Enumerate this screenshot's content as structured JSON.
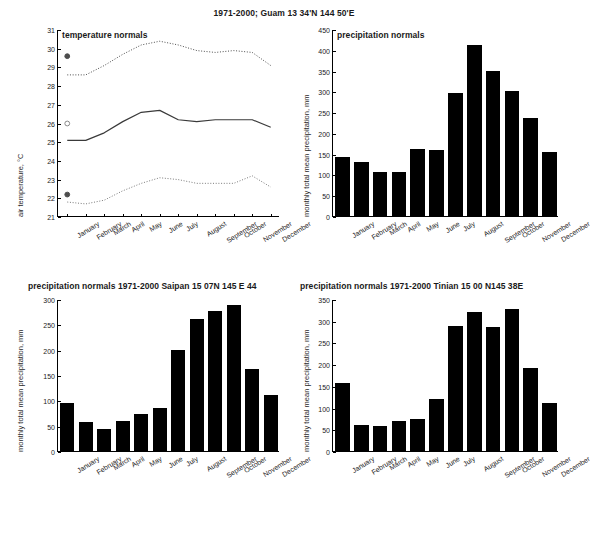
{
  "figure": {
    "title": "1971-2000; Guam 13 34'N 144 50'E",
    "caption": ""
  },
  "chart_data": [
    {
      "id": "temperature-normals",
      "type": "line",
      "title": "temperature normals",
      "xlabel": "",
      "ylabel": "air temperature, °C",
      "ylim": [
        21,
        31
      ],
      "yticks": [
        21,
        22,
        23,
        24,
        25,
        26,
        27,
        28,
        29,
        30,
        31
      ],
      "grid": false,
      "legend": "none",
      "categories": [
        "January",
        "February",
        "March",
        "April",
        "May",
        "June",
        "July",
        "August",
        "September",
        "October",
        "November",
        "December"
      ],
      "series": [
        {
          "name": "mean daily maximum",
          "style": "dotted",
          "color": "#4d4d4d",
          "values": [
            28.6,
            28.6,
            29.1,
            29.7,
            30.2,
            30.4,
            30.2,
            29.9,
            29.8,
            29.9,
            29.8,
            29.1
          ]
        },
        {
          "name": "mean daily temperature",
          "style": "solid",
          "color": "#3a3a3a",
          "values": [
            25.1,
            25.1,
            25.5,
            26.1,
            26.6,
            26.7,
            26.2,
            26.1,
            26.2,
            26.2,
            26.2,
            25.8
          ]
        },
        {
          "name": "mean daily minimum",
          "style": "dotted",
          "color": "#7a7a7a",
          "values": [
            21.8,
            21.7,
            21.9,
            22.4,
            22.8,
            23.1,
            23.0,
            22.8,
            22.8,
            22.8,
            23.2,
            22.6
          ]
        }
      ],
      "markers": [
        {
          "name": "annual-mean-maximum-marker",
          "symbol": "filled-circle",
          "color": "#4d4d4d",
          "x_category": "January",
          "y": 29.6
        },
        {
          "name": "annual-mean-marker",
          "symbol": "open-circle",
          "color": "#8a8a8a",
          "x_category": "January",
          "y": 26.0
        },
        {
          "name": "annual-mean-minimum-marker",
          "symbol": "filled-circle",
          "color": "#4d4d4d",
          "x_category": "January",
          "y": 22.2
        }
      ]
    },
    {
      "id": "precipitation-normals-guam",
      "type": "bar",
      "title": "precipitation normals",
      "xlabel": "",
      "ylabel": "monthly total mean precipitation, mm",
      "ylim": [
        0,
        450
      ],
      "yticks": [
        0,
        50,
        100,
        150,
        200,
        250,
        300,
        350,
        400,
        450
      ],
      "grid": false,
      "bar_color": "#000000",
      "categories": [
        "January",
        "February",
        "March",
        "April",
        "May",
        "June",
        "July",
        "August",
        "September",
        "October",
        "November",
        "December"
      ],
      "values": [
        141,
        129,
        107,
        105,
        162,
        159,
        296,
        411,
        348,
        301,
        237,
        154
      ]
    },
    {
      "id": "precipitation-normals-saipan",
      "type": "bar",
      "title": "precipitation normals 1971-2000 Saipan 15 07N  145   E 44",
      "xlabel": "",
      "ylabel": "monthly total mean precipitation, mm",
      "ylim": [
        0,
        300
      ],
      "yticks": [
        0,
        50,
        100,
        150,
        200,
        250,
        300
      ],
      "grid": false,
      "bar_color": "#000000",
      "categories": [
        "January",
        "February",
        "March",
        "April",
        "May",
        "June",
        "July",
        "August",
        "September",
        "October",
        "November",
        "December"
      ],
      "values": [
        95,
        57,
        44,
        59,
        73,
        85,
        199,
        260,
        276,
        289,
        161,
        111
      ]
    },
    {
      "id": "precipitation-normals-tinian",
      "type": "bar",
      "title": "precipitation normals 1971-2000 Tinian 15 00  N145  38E",
      "xlabel": "",
      "ylabel": "monthly total mean precipitation, mm",
      "ylim": [
        0,
        350
      ],
      "yticks": [
        0,
        50,
        100,
        150,
        200,
        250,
        300,
        350
      ],
      "grid": false,
      "bar_color": "#000000",
      "categories": [
        "January",
        "February",
        "March",
        "April",
        "May",
        "June",
        "July",
        "August",
        "September",
        "October",
        "November",
        "December"
      ],
      "values": [
        157,
        61,
        57,
        69,
        74,
        120,
        288,
        321,
        286,
        328,
        192,
        111
      ]
    }
  ]
}
